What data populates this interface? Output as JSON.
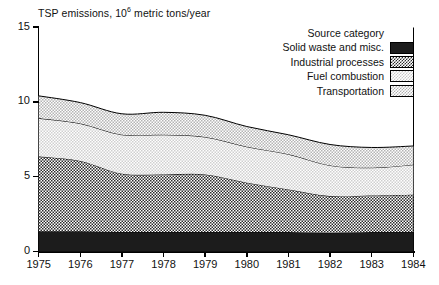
{
  "chart_data": {
    "type": "area",
    "title_main": "TSP emissions, 10",
    "title_sup": "6",
    "title_tail": " metric tons/year",
    "xlabel": "",
    "ylabel": "",
    "stacked": true,
    "grid": false,
    "legend_position": "top-right",
    "legend_title": "Source category",
    "xlim": [
      1975,
      1984
    ],
    "ylim": [
      0,
      15
    ],
    "y_ticks": [
      "0",
      "5",
      "10",
      "15"
    ],
    "y_tick_values": [
      0,
      5,
      10,
      15
    ],
    "categories": [
      1975,
      1976,
      1977,
      1978,
      1979,
      1980,
      1981,
      1982,
      1983,
      1984
    ],
    "x_tick_labels": [
      "1975",
      "1976",
      "1977",
      "1978",
      "1979",
      "1980",
      "1981",
      "1982",
      "1983",
      "1984"
    ],
    "series": [
      {
        "name": "Solid waste and misc.",
        "swatch": "solid-black",
        "color": "#1c1c1c",
        "values": [
          1.35,
          1.35,
          1.3,
          1.3,
          1.3,
          1.3,
          1.3,
          1.25,
          1.3,
          1.3
        ]
      },
      {
        "name": "Industrial processes",
        "swatch": "dark-checker",
        "color": "#2b2b2b",
        "values": [
          5.0,
          4.7,
          3.9,
          3.85,
          3.85,
          3.3,
          2.85,
          2.45,
          2.45,
          2.5
        ]
      },
      {
        "name": "Fuel combustion",
        "swatch": "light-dots",
        "color": "#c9c9c9",
        "values": [
          2.55,
          2.5,
          2.6,
          2.65,
          2.5,
          2.4,
          2.35,
          2.05,
          1.85,
          2.0
        ]
      },
      {
        "name": "Transportation",
        "swatch": "mid-dots",
        "color": "#b0b0b0",
        "values": [
          1.5,
          1.4,
          1.4,
          1.5,
          1.45,
          1.35,
          1.3,
          1.4,
          1.35,
          1.25
        ]
      }
    ],
    "cumulative_tops": {
      "solid_waste_and_misc": [
        1.35,
        1.35,
        1.3,
        1.3,
        1.3,
        1.3,
        1.3,
        1.25,
        1.3,
        1.3
      ],
      "industrial_processes": [
        6.35,
        6.05,
        5.2,
        5.15,
        5.15,
        4.6,
        4.15,
        3.7,
        3.75,
        3.8
      ],
      "fuel_combustion": [
        8.9,
        8.55,
        7.8,
        7.8,
        7.65,
        7.0,
        6.5,
        5.75,
        5.6,
        5.8
      ],
      "transportation": [
        10.4,
        9.95,
        9.2,
        9.3,
        9.1,
        8.35,
        7.8,
        7.15,
        6.95,
        7.05
      ]
    }
  }
}
